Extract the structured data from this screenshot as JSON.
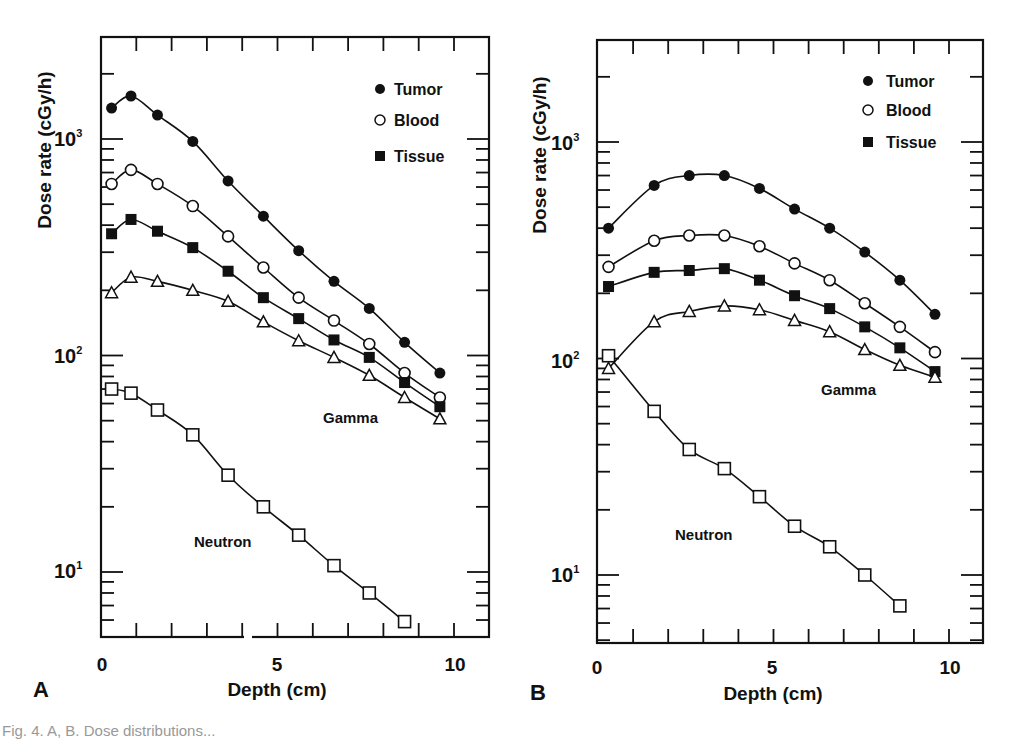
{
  "chart_data": [
    {
      "panel": "A",
      "type": "line",
      "xlabel": "Depth (cm)",
      "ylabel": "Dose rate (cGy/h)",
      "yscale": "log",
      "xlim": [
        0,
        11
      ],
      "ylim": [
        5,
        3000
      ],
      "xticks": [
        "0",
        "5",
        "10"
      ],
      "yticks": [
        "10¹",
        "10²",
        "10³"
      ],
      "legend": [
        "Tumor",
        "Blood",
        "Tissue"
      ],
      "legend_position": "upper right",
      "annotations": [
        "Gamma",
        "Neutron"
      ],
      "grid": false,
      "series": [
        {
          "name": "Tumor",
          "group": "Gamma",
          "marker": "filled-circle",
          "x": [
            0.3,
            0.85,
            1.6,
            2.6,
            3.6,
            4.6,
            5.6,
            6.6,
            7.6,
            8.6,
            9.6
          ],
          "values": [
            1390,
            1580,
            1290,
            975,
            640,
            440,
            305,
            220,
            165,
            115,
            83
          ]
        },
        {
          "name": "Blood",
          "group": "Gamma",
          "marker": "open-circle",
          "x": [
            0.3,
            0.85,
            1.6,
            2.6,
            3.6,
            4.6,
            5.6,
            6.6,
            7.6,
            8.6,
            9.6
          ],
          "values": [
            620,
            720,
            620,
            490,
            355,
            255,
            185,
            145,
            113,
            83,
            64
          ]
        },
        {
          "name": "Tissue",
          "group": "Gamma",
          "marker": "filled-square",
          "x": [
            0.3,
            0.85,
            1.6,
            2.6,
            3.6,
            4.6,
            5.6,
            6.6,
            7.6,
            8.6,
            9.6
          ],
          "values": [
            365,
            425,
            375,
            315,
            245,
            185,
            148,
            118,
            98,
            75,
            58
          ]
        },
        {
          "name": "Gamma (other)",
          "group": "Gamma",
          "marker": "open-triangle",
          "x": [
            0.3,
            0.85,
            1.6,
            2.6,
            3.6,
            4.6,
            5.6,
            6.6,
            7.6,
            8.6,
            9.6
          ],
          "values": [
            195,
            230,
            220,
            200,
            178,
            143,
            117,
            98,
            81,
            64,
            51
          ]
        },
        {
          "name": "Neutron",
          "group": "Neutron",
          "marker": "open-square",
          "x": [
            0.3,
            0.85,
            1.6,
            2.6,
            3.6,
            4.6,
            5.6,
            6.6,
            7.6,
            8.6
          ],
          "values": [
            70,
            67,
            56,
            43,
            28,
            20,
            14.8,
            10.7,
            8.0,
            5.9
          ]
        }
      ]
    },
    {
      "panel": "B",
      "type": "line",
      "xlabel": "Depth (cm)",
      "ylabel": "Dose rate (cGy/h)",
      "yscale": "log",
      "xlim": [
        0,
        11
      ],
      "ylim": [
        5,
        3000
      ],
      "xticks": [
        "0",
        "5",
        "10"
      ],
      "yticks": [
        "10¹",
        "10²",
        "10³"
      ],
      "legend": [
        "Tumor",
        "Blood",
        "Tissue"
      ],
      "legend_position": "upper right",
      "annotations": [
        "Gamma",
        "Neutron"
      ],
      "grid": false,
      "series": [
        {
          "name": "Tumor",
          "group": "Gamma",
          "marker": "filled-circle",
          "x": [
            0.3,
            1.6,
            2.6,
            3.6,
            4.6,
            5.6,
            6.6,
            7.6,
            8.6,
            9.6
          ],
          "values": [
            400,
            630,
            700,
            700,
            610,
            490,
            400,
            310,
            230,
            160
          ]
        },
        {
          "name": "Blood",
          "group": "Gamma",
          "marker": "open-circle",
          "x": [
            0.3,
            1.6,
            2.6,
            3.6,
            4.6,
            5.6,
            6.6,
            7.6,
            8.6,
            9.6
          ],
          "values": [
            265,
            350,
            370,
            370,
            330,
            275,
            230,
            180,
            140,
            107
          ]
        },
        {
          "name": "Tissue",
          "group": "Gamma",
          "marker": "filled-square",
          "x": [
            0.3,
            1.6,
            2.6,
            3.6,
            4.6,
            5.6,
            6.6,
            7.6,
            8.6,
            9.6
          ],
          "values": [
            215,
            250,
            255,
            260,
            230,
            195,
            170,
            140,
            112,
            87
          ]
        },
        {
          "name": "Gamma (other)",
          "group": "Gamma",
          "marker": "open-triangle",
          "x": [
            0.3,
            1.6,
            2.6,
            3.6,
            4.6,
            5.6,
            6.6,
            7.6,
            8.6,
            9.6
          ],
          "values": [
            90,
            148,
            165,
            175,
            168,
            150,
            133,
            110,
            93,
            82
          ]
        },
        {
          "name": "Neutron",
          "group": "Neutron",
          "marker": "open-square",
          "x": [
            0.3,
            1.6,
            2.6,
            3.6,
            4.6,
            5.6,
            6.6,
            7.6,
            8.6
          ],
          "values": [
            103,
            57,
            38,
            31,
            23,
            16.8,
            13.5,
            10,
            7.2
          ]
        }
      ]
    }
  ],
  "panels": [
    {
      "letter": "A",
      "xlabel": "Depth (cm)",
      "ylabel": "Dose rate (cGy/h)",
      "legend": {
        "tumor": "Tumor",
        "blood": "Blood",
        "tissue": "Tissue"
      },
      "gamma_label": "Gamma",
      "neutron_label": "Neutron",
      "xtick_labels": [
        "0",
        "5",
        "10"
      ]
    },
    {
      "letter": "B",
      "xlabel": "Depth (cm)",
      "ylabel": "Dose rate (cGy/h)",
      "legend": {
        "tumor": "Tumor",
        "blood": "Blood",
        "tissue": "Tissue"
      },
      "gamma_label": "Gamma",
      "neutron_label": "Neutron",
      "xtick_labels": [
        "0",
        "5",
        "10"
      ]
    }
  ],
  "caption": "Fig. 4. A, B. Dose distributions..."
}
